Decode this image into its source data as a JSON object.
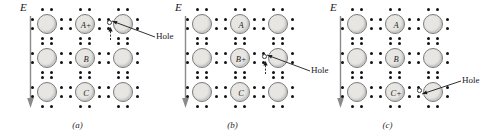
{
  "figure": {
    "type": "diagram",
    "background_color": "#ffffff",
    "atom_fill_color": "#e8e6e2",
    "atom_stroke_color": "#7a7a7a",
    "dot_color": "#121212",
    "line_color": "#1a1a1a"
  },
  "panels": [
    {
      "id": "a",
      "caption": "(a)",
      "field": {
        "label": "E",
        "direction": "down"
      },
      "atoms": [
        {
          "row": 0,
          "col": 0,
          "label": ""
        },
        {
          "row": 0,
          "col": 1,
          "label": "A+"
        },
        {
          "row": 0,
          "col": 2,
          "label": ""
        },
        {
          "row": 1,
          "col": 0,
          "label": ""
        },
        {
          "row": 1,
          "col": 1,
          "label": "B"
        },
        {
          "row": 1,
          "col": 2,
          "label": ""
        },
        {
          "row": 2,
          "col": 0,
          "label": ""
        },
        {
          "row": 2,
          "col": 1,
          "label": "C"
        },
        {
          "row": 2,
          "col": 2,
          "label": ""
        }
      ],
      "hole": {
        "label": "Hole",
        "row": 0,
        "col": 2,
        "position": "left-of-atom-row0-col2"
      },
      "motion_arrow": {
        "direction": "up",
        "meaning": "electron moves up into hole"
      }
    },
    {
      "id": "b",
      "caption": "(b)",
      "field": {
        "label": "E",
        "direction": "down"
      },
      "atoms": [
        {
          "row": 0,
          "col": 0,
          "label": ""
        },
        {
          "row": 0,
          "col": 1,
          "label": "A"
        },
        {
          "row": 0,
          "col": 2,
          "label": ""
        },
        {
          "row": 1,
          "col": 0,
          "label": ""
        },
        {
          "row": 1,
          "col": 1,
          "label": "B+"
        },
        {
          "row": 1,
          "col": 2,
          "label": ""
        },
        {
          "row": 2,
          "col": 0,
          "label": ""
        },
        {
          "row": 2,
          "col": 1,
          "label": "C"
        },
        {
          "row": 2,
          "col": 2,
          "label": ""
        }
      ],
      "hole": {
        "label": "Hole",
        "row": 1,
        "col": 2,
        "position": "left-of-atom-row1-col2"
      },
      "motion_arrow": {
        "direction": "up",
        "meaning": "electron moves up into hole"
      }
    },
    {
      "id": "c",
      "caption": "(c)",
      "field": {
        "label": "E",
        "direction": "down"
      },
      "atoms": [
        {
          "row": 0,
          "col": 0,
          "label": ""
        },
        {
          "row": 0,
          "col": 1,
          "label": "A"
        },
        {
          "row": 0,
          "col": 2,
          "label": ""
        },
        {
          "row": 1,
          "col": 0,
          "label": ""
        },
        {
          "row": 1,
          "col": 1,
          "label": "B"
        },
        {
          "row": 1,
          "col": 2,
          "label": ""
        },
        {
          "row": 2,
          "col": 0,
          "label": ""
        },
        {
          "row": 2,
          "col": 1,
          "label": "C+"
        },
        {
          "row": 2,
          "col": 2,
          "label": ""
        }
      ],
      "hole": {
        "label": "Hole",
        "row": 2,
        "col": 2,
        "position": "left-of-atom-row2-col2"
      },
      "motion_arrow": null
    }
  ]
}
